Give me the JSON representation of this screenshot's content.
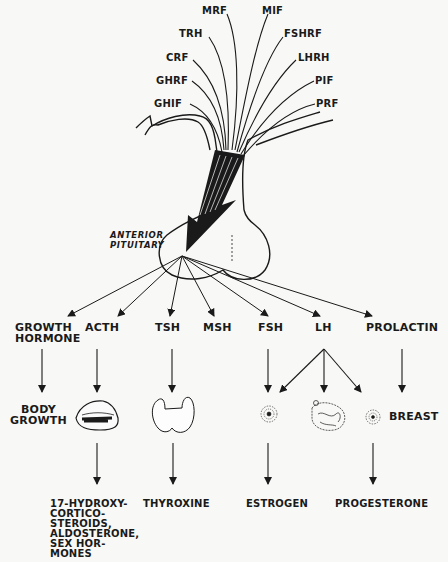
{
  "colors": {
    "ink": "#1a1a1a",
    "paper": "#f8f8f6"
  },
  "hypothalamic_factors": {
    "left": [
      "MRF",
      "TRH",
      "CRF",
      "GHRF",
      "GHIF"
    ],
    "right": [
      "MIF",
      "FSHRF",
      "LHRH",
      "PIF",
      "PRF"
    ]
  },
  "gland_label": "ANTERIOR\nPITUITARY",
  "hormones": [
    {
      "id": "gh",
      "label": "GROWTH\nHORMONE"
    },
    {
      "id": "acth",
      "label": "ACTH"
    },
    {
      "id": "tsh",
      "label": "TSH"
    },
    {
      "id": "msh",
      "label": "MSH"
    },
    {
      "id": "fsh",
      "label": "FSH"
    },
    {
      "id": "lh",
      "label": "LH"
    },
    {
      "id": "prolactin",
      "label": "PROLACTIN"
    }
  ],
  "targets": {
    "body_growth": "BODY\nGROWTH",
    "adrenal_icon": "adrenal-gland-icon",
    "thyroid_icon": "thyroid-gland-icon",
    "ovary_follicle_icon": "ovarian-follicle-icon",
    "ovary_icon": "ovary-icon",
    "corpus_luteum_icon": "corpus-luteum-icon",
    "breast": "BREAST"
  },
  "products": {
    "adrenal": "17-HYDROXY-\nCORTICO-\nSTEROIDS,\nALDOSTERONE,\nSEX HOR-\nMONES",
    "thyroid": "THYROXINE",
    "follicle": "ESTROGEN",
    "corpus_luteum": "PROGESTERONE"
  }
}
